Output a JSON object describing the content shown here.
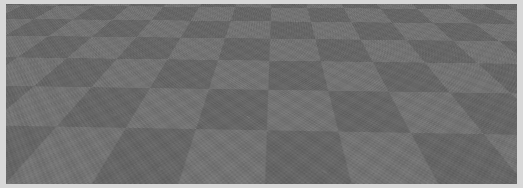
{
  "app": {
    "name": "3d-viewport",
    "title": "3D Scene Viewport",
    "shading_mode": "Solid"
  },
  "viewport": {
    "width": 523,
    "height": 188,
    "background_color": "#050505",
    "frame_color": "#d8d8d8"
  },
  "ground": {
    "name": "Checkerboard Ground Plane",
    "checker_light": "#7c7c7c",
    "checker_dark": "#636363",
    "tile_size_px": 46,
    "tilt_description": "perspective floor receding to the top of the frame"
  },
  "selection": {
    "label": "Selected Object",
    "outline_color": "#e4e4e4",
    "handle_color": "#e9e9e9",
    "handle_count": 4,
    "handles": [
      {
        "name": "corner-top-left",
        "x": 371,
        "y": 19
      },
      {
        "name": "corner-top-right",
        "x": 473,
        "y": 17
      },
      {
        "name": "corner-bottom-left",
        "x": 375,
        "y": 98
      },
      {
        "name": "corner-bottom-right",
        "x": 497,
        "y": 97
      }
    ]
  },
  "gizmo": {
    "name": "Transform Gizmo",
    "type": "move",
    "origin_color": "#ffffff",
    "axis_color": "#0a0a0a",
    "axes": [
      {
        "name": "axis-x",
        "direction": "left",
        "label": "X"
      },
      {
        "name": "axis-y",
        "direction": "up",
        "label": "Y"
      },
      {
        "name": "axis-z",
        "direction": "depth",
        "label": "Z"
      }
    ],
    "origin": {
      "x": 425,
      "y": 59
    }
  },
  "overlay": {
    "status_text": "",
    "coordinates": ""
  }
}
